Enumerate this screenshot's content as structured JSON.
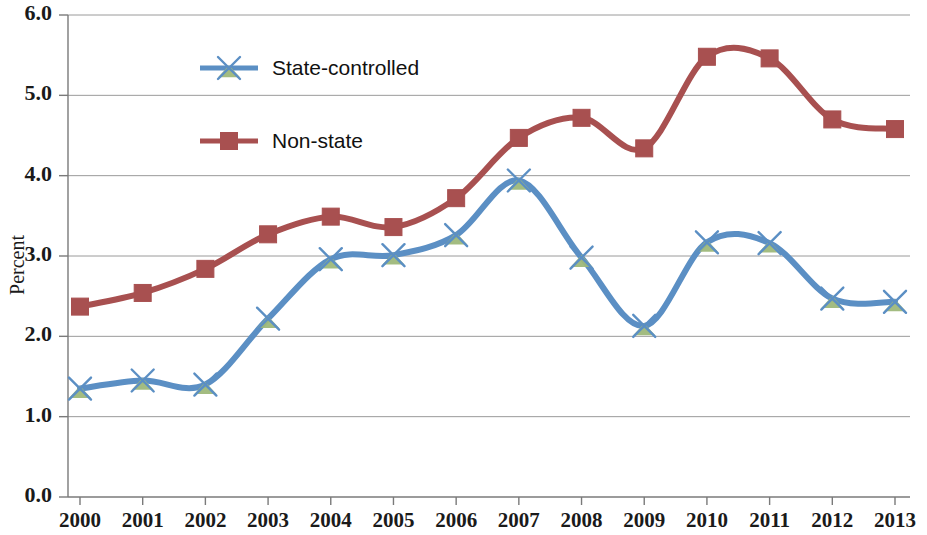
{
  "chart_data": {
    "type": "line",
    "title": "",
    "subtitle": "",
    "xlabel": "",
    "ylabel": "Percent",
    "x": [
      2000,
      2001,
      2002,
      2003,
      2004,
      2005,
      2006,
      2007,
      2008,
      2009,
      2010,
      2011,
      2012,
      2013
    ],
    "categories": [
      "2000",
      "2001",
      "2002",
      "2003",
      "2004",
      "2005",
      "2006",
      "2007",
      "2008",
      "2009",
      "2010",
      "2011",
      "2012",
      "2013"
    ],
    "xlim": [
      2000,
      2013
    ],
    "ylim": [
      0.0,
      6.0
    ],
    "ytick_labels": [
      "0.0",
      "1.0",
      "2.0",
      "3.0",
      "4.0",
      "5.0",
      "6.0"
    ],
    "ytick_values": [
      0.0,
      1.0,
      2.0,
      3.0,
      4.0,
      5.0,
      6.0
    ],
    "grid": "horizontal",
    "legend_position": "inside-upper-left",
    "smoothing": "spline",
    "series": [
      {
        "name": "State-controlled",
        "color": "#5b8fc4",
        "marker": "x-star",
        "marker_color": "#9eb87a",
        "values": [
          1.35,
          1.45,
          1.4,
          2.22,
          2.96,
          3.01,
          3.26,
          3.94,
          2.98,
          2.13,
          3.17,
          3.16,
          2.47,
          2.43
        ]
      },
      {
        "name": "Non-state",
        "color": "#a85050",
        "marker": "square",
        "marker_color": "#a85050",
        "values": [
          2.37,
          2.54,
          2.84,
          3.27,
          3.49,
          3.36,
          3.72,
          4.47,
          4.72,
          4.34,
          5.48,
          5.46,
          4.7,
          4.58
        ]
      }
    ]
  },
  "legend": {
    "items": [
      {
        "label": "State-controlled"
      },
      {
        "label": "Non-state"
      }
    ]
  },
  "axis": {
    "y_title": "Percent"
  }
}
